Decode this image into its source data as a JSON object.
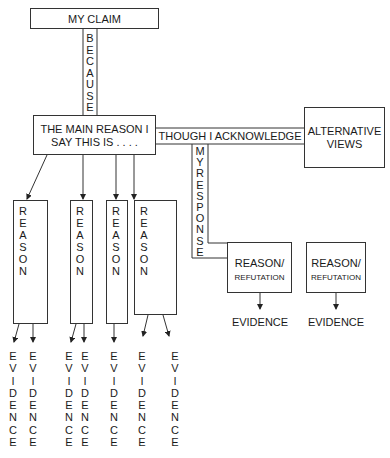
{
  "diagram": {
    "claim": "MY CLAIM",
    "because": "BECAUSE",
    "main_reason": [
      "THE MAIN REASON I",
      "SAY THIS IS . . . ."
    ],
    "though": "THOUGH I ACKNOWLEDGE",
    "alternative_views": [
      "ALTERNATIVE",
      "VIEWS"
    ],
    "my_response": "MY RESPONSE",
    "reasons": [
      {
        "label": "REASON",
        "evidence": [
          "EVIDENCE",
          "EVIDENCE"
        ]
      },
      {
        "label": "REASON",
        "evidence": [
          "EVIDENCE",
          "EVIDENCE"
        ]
      },
      {
        "label": "REASON",
        "evidence": [
          "EVIDENCE"
        ]
      },
      {
        "label": "REASON",
        "evidence": [
          "EVIDENCE",
          "EVIDENCE"
        ]
      }
    ],
    "refutations": [
      {
        "line1": "REASON/",
        "line2": "REFUTATION",
        "evidence": "EVIDENCE"
      },
      {
        "line1": "REASON/",
        "line2": "REFUTATION",
        "evidence": "EVIDENCE"
      }
    ]
  }
}
